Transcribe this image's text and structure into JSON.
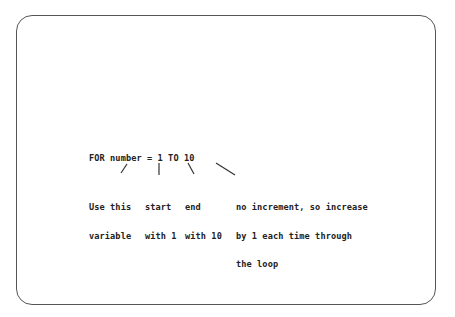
{
  "code_line": "FOR number = 1 TO 10",
  "annotations": [
    {
      "id": "variable",
      "lines": [
        "Use this",
        "variable"
      ]
    },
    {
      "id": "start",
      "lines": [
        "start",
        "with 1"
      ]
    },
    {
      "id": "end",
      "lines": [
        "end",
        "with 10"
      ]
    },
    {
      "id": "increment",
      "lines": [
        "no increment, so increase",
        "by 1 each time through",
        "the loop"
      ]
    }
  ]
}
